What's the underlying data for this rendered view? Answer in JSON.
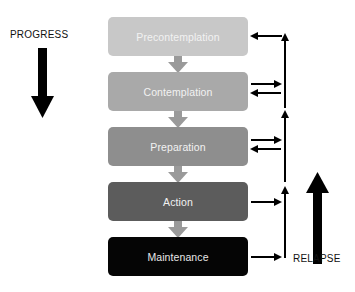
{
  "diagram": {
    "progress_label": "PROGRESS",
    "relapse_label": "RELAPSE",
    "stages": [
      {
        "label": "Precontemplation",
        "color": "#c8c8c8"
      },
      {
        "label": "Contemplation",
        "color": "#a9a9a9"
      },
      {
        "label": "Preparation",
        "color": "#8e8e8e"
      },
      {
        "label": "Action",
        "color": "#5c5c5c"
      },
      {
        "label": "Maintenance",
        "color": "#050505"
      }
    ],
    "connector_arrow_color": "#9a9a9a",
    "relapse_arrows": [
      {
        "stage": "Precontemplation",
        "direction": "incoming"
      },
      {
        "stage": "Contemplation",
        "direction": "bidirectional"
      },
      {
        "stage": "Preparation",
        "direction": "bidirectional"
      },
      {
        "stage": "Action",
        "direction": "outgoing"
      },
      {
        "stage": "Maintenance",
        "direction": "outgoing"
      }
    ]
  }
}
